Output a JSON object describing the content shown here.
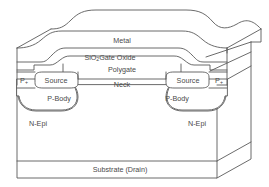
{
  "diagram": {
    "colors": {
      "background": "#ffffff",
      "line": "#5a5a5a",
      "text": "#4a4a4a"
    },
    "labels": {
      "metal": "Metal",
      "gate_oxide_main": "SiO",
      "gate_oxide_sub": "2",
      "gate_oxide_rest": "Gate Oxide",
      "polygate": "Polygate",
      "neck": "Neck",
      "source_left": "Source",
      "source_right": "Source",
      "pplus_left_main": "P",
      "pplus_left_sub": "+",
      "pplus_right_main": "P",
      "pplus_right_sub": "+",
      "pbody_left": "P-Body",
      "pbody_right": "P-Body",
      "nepi_left": "N-Epi",
      "nepi_right": "N-Epi",
      "substrate": "Substrate (Drain)"
    }
  }
}
